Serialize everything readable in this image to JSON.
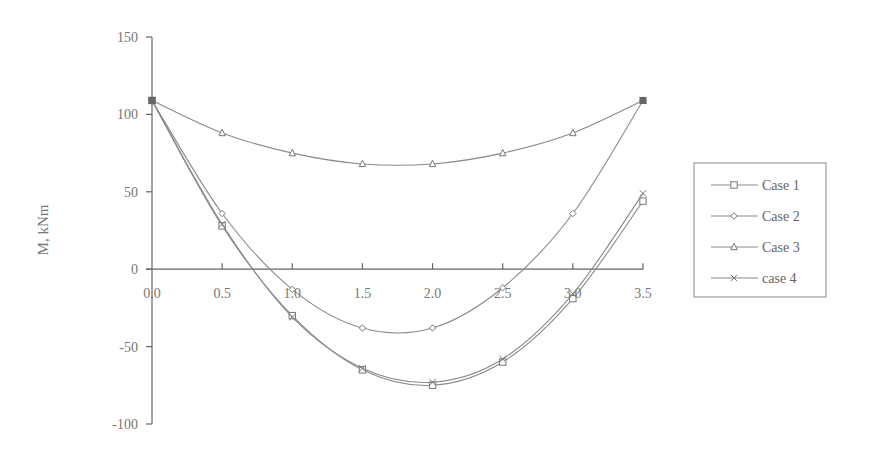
{
  "chart_data": {
    "type": "line",
    "title": "",
    "xlabel": "",
    "ylabel": "M, kNm",
    "x": [
      0.0,
      0.5,
      1.0,
      1.5,
      2.0,
      2.5,
      3.0,
      3.5
    ],
    "xticks": [
      "0.0",
      "0.5",
      "1.0",
      "1.5",
      "2.0",
      "2.5",
      "3.0",
      "3.5"
    ],
    "yticks": [
      "150",
      "100",
      "50",
      "0",
      "-50",
      "-100"
    ],
    "xlim": [
      0,
      3.5
    ],
    "ylim": [
      -100,
      150
    ],
    "grid": false,
    "legend_position": "right",
    "series": [
      {
        "name": "Case 1",
        "marker": "square",
        "values": [
          109,
          28,
          -30,
          -65,
          -75,
          -60,
          -19,
          44
        ]
      },
      {
        "name": "Case 2",
        "marker": "diamond",
        "values": [
          109,
          36,
          -13,
          -38,
          -38,
          -12,
          36,
          109
        ]
      },
      {
        "name": "Case 3",
        "marker": "triangle",
        "values": [
          109,
          88,
          75,
          68,
          68,
          75,
          88,
          109
        ]
      },
      {
        "name": "case 4",
        "marker": "cross",
        "values": [
          109,
          29,
          -31,
          -64,
          -73,
          -58,
          -16,
          49
        ]
      }
    ]
  },
  "colors": {
    "axis": "#666666",
    "series": "#8a8a8a",
    "text": "#777777"
  }
}
